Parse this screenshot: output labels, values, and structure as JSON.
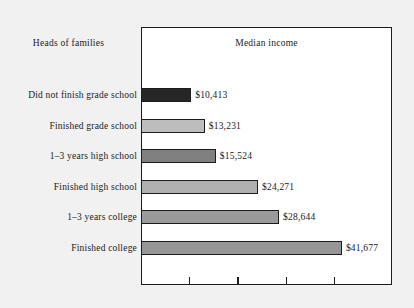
{
  "group_label": "Heads of families",
  "chart_data": {
    "type": "bar",
    "orientation": "horizontal",
    "title": "Median income",
    "xlabel": "",
    "ylabel": "Heads of families",
    "grid": false,
    "legend": "none",
    "xlim": [
      0,
      46000
    ],
    "axis_ticks": [
      10000,
      20000,
      30000,
      40000
    ],
    "axis_tick_labels": [
      "",
      "",
      "",
      ""
    ],
    "categories": [
      "Did not finish grade school",
      "Finished grade school",
      "1–3 years high school",
      "Finished high school",
      "1–3 years college",
      "Finished college"
    ],
    "values": [
      10413,
      13231,
      15524,
      24271,
      28644,
      41677
    ],
    "value_labels": [
      "$10,413",
      "$13,231",
      "$15,524",
      "$24,271",
      "$28,644",
      "$41,677"
    ],
    "bar_colors": [
      "#262626",
      "#bdbdbd",
      "#808080",
      "#b0b0b0",
      "#9a9a9a",
      "#969696"
    ],
    "bar_edge_color": "#1c1c1c",
    "plot_background": "#ffffff",
    "figure_background": "#f1f1f1"
  }
}
